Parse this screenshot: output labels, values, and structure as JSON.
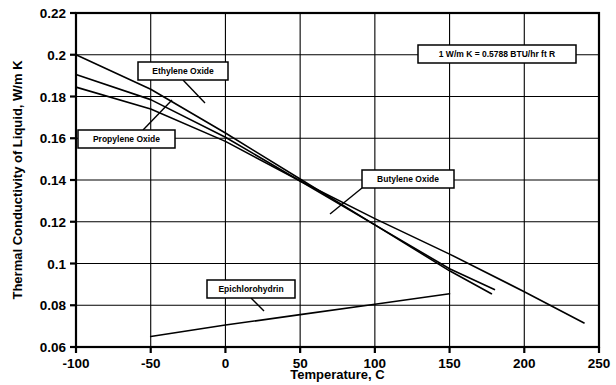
{
  "chart_data": {
    "type": "line",
    "title": "",
    "xlabel": "Temperature, C",
    "ylabel": "Thermal Conductivity of Liquid, W/m K",
    "xlim": [
      -100,
      250
    ],
    "ylim": [
      0.06,
      0.22
    ],
    "xticks": [
      -100,
      -50,
      0,
      50,
      100,
      150,
      200,
      250
    ],
    "xtick_labels": [
      "-100",
      "-50",
      "0",
      "50",
      "100",
      "150",
      "200",
      "250"
    ],
    "yticks": [
      0.06,
      0.08,
      0.1,
      0.12,
      0.14,
      0.16,
      0.18,
      0.2,
      0.22
    ],
    "ytick_labels": [
      "0.06",
      "0.08",
      "0.1",
      "0.12",
      "0.14",
      "0.16",
      "0.18",
      "0.2",
      "0.22"
    ],
    "grid": true,
    "legend": "none",
    "line_color": "#000000",
    "series": [
      {
        "name": "Ethylene Oxide",
        "x": [
          -100,
          -50,
          0,
          50,
          100,
          150,
          178
        ],
        "y": [
          0.2,
          0.1835,
          0.1625,
          0.1405,
          0.1185,
          0.0965,
          0.0855
        ]
      },
      {
        "name": "Propylene Oxide",
        "x": [
          -100,
          -50,
          0,
          50,
          100,
          150,
          180
        ],
        "y": [
          0.1905,
          0.1785,
          0.1605,
          0.1395,
          0.1185,
          0.0975,
          0.0875
        ]
      },
      {
        "name": "Butylene Oxide",
        "x": [
          -100,
          -50,
          0,
          50,
          100,
          150,
          200,
          240
        ],
        "y": [
          0.1845,
          0.174,
          0.1585,
          0.1395,
          0.1215,
          0.1045,
          0.0865,
          0.0715
        ]
      },
      {
        "name": "Epichlorohydrin",
        "x": [
          -50,
          0,
          50,
          100,
          150
        ],
        "y": [
          0.065,
          0.0705,
          0.0755,
          0.0805,
          0.0855
        ]
      }
    ],
    "annotations": [
      {
        "name": "unit-conversion-note",
        "text": "1 W/m K  =  0.5788 BTU/hr ft R",
        "box_x": 418,
        "box_y": 45,
        "box_w": 158,
        "box_h": 18
      }
    ],
    "callouts": [
      {
        "name": "ethylene-oxide-callout",
        "label": "Ethylene Oxide",
        "box_x": 138,
        "box_y": 62,
        "box_w": 90,
        "box_h": 18,
        "leader_from_x": 183,
        "leader_from_y": 80,
        "leader_to_x": 205,
        "leader_to_y": 103
      },
      {
        "name": "propylene-oxide-callout",
        "label": "Propylene Oxide",
        "box_x": 78,
        "box_y": 130,
        "box_w": 97,
        "box_h": 18,
        "leader_from_x": 143,
        "leader_from_y": 130,
        "leader_to_x": 172,
        "leader_to_y": 100
      },
      {
        "name": "butylene-oxide-callout",
        "label": "Butylene Oxide",
        "box_x": 362,
        "box_y": 170,
        "box_w": 92,
        "box_h": 18,
        "leader_from_x": 362,
        "leader_from_y": 188,
        "leader_to_x": 330,
        "leader_to_y": 214
      },
      {
        "name": "epichlorohydrin-callout",
        "label": "Epichlorohydrin",
        "box_x": 207,
        "box_y": 280,
        "box_w": 88,
        "box_h": 18,
        "leader_from_x": 251,
        "leader_from_y": 298,
        "leader_to_x": 264,
        "leader_to_y": 311
      }
    ],
    "plot_box": {
      "left": 76,
      "top": 13,
      "right": 599,
      "bottom": 347
    }
  }
}
